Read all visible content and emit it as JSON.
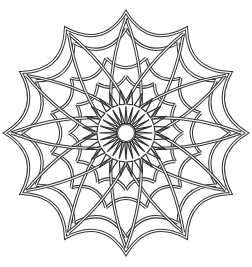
{
  "image": {
    "subject": "Line-art mandala with 12-point star outline",
    "caption": "mandala",
    "stroke_color": "#333333",
    "background": "#ffffff",
    "points": 12,
    "center": [
      126,
      133
    ],
    "outer_radius": 121
  }
}
